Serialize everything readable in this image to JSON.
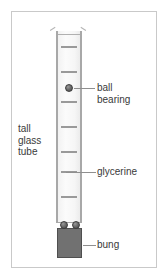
{
  "figure": {
    "background_color": "#ffffff",
    "frame_color": "#c9c9c9",
    "width": 168,
    "height": 279
  },
  "apparatus": {
    "tube": {
      "name": "tall glass tube",
      "wall_color": "#a8a8a8",
      "glass_fill_color": "#f6f6f6",
      "graduation_tick_color": "#9a9a9a",
      "graduation_count": 7
    },
    "liquid": {
      "name": "glycerine",
      "color": "#f6f6f6"
    },
    "ball_bearing": {
      "name": "ball bearing",
      "color": "#6e6e6e",
      "outline_color": "#3c3c3c",
      "count_falling": 1,
      "count_settled": 2
    },
    "bung": {
      "name": "bung",
      "color": "#717171",
      "outline_color": "#4f4f4f"
    }
  },
  "labels": {
    "tall_glass_tube": "tall\nglass\ntube",
    "ball_bearing": "ball\nbearing",
    "glycerine": "glycerine",
    "bung": "bung"
  },
  "leader_lines": {
    "color": "#8f8f8f",
    "items": [
      {
        "target": "ball-bearing",
        "label": "ball bearing"
      },
      {
        "target": "glycerine",
        "label": "glycerine"
      },
      {
        "target": "bung",
        "label": "bung"
      }
    ]
  },
  "graduations": {
    "tick_tops": [
      46,
      71,
      101,
      126,
      151,
      171,
      196
    ]
  }
}
